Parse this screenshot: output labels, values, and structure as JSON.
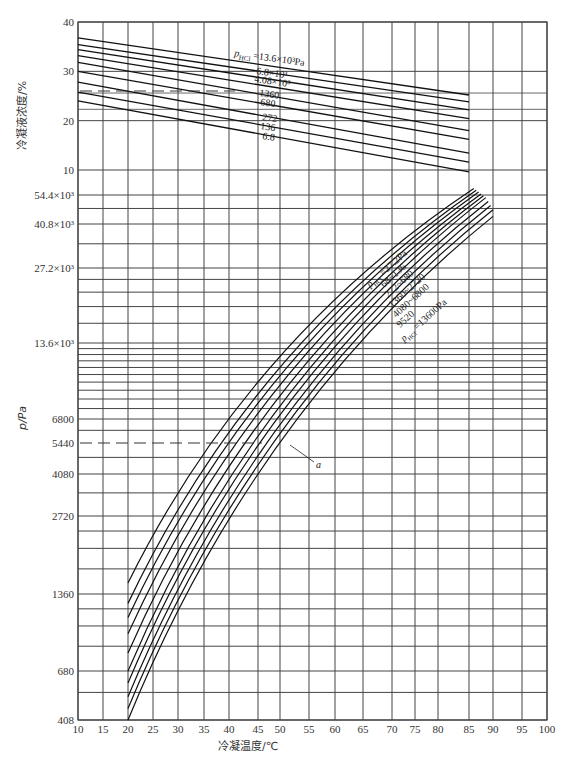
{
  "chart_data": [
    {
      "type": "line",
      "title": "",
      "ylabel": "冷凝液浓度/%",
      "xlabel": "冷凝温度/℃",
      "ylim": [
        10,
        40
      ],
      "y_ticks": [
        "40",
        "30",
        "20",
        "10"
      ],
      "x_ticks": [
        "10",
        "15",
        "20",
        "25",
        "30",
        "35",
        "40",
        "45",
        "50",
        "55",
        "60",
        "65",
        "70",
        "75",
        "80",
        "85",
        "90",
        "95",
        "100"
      ],
      "grid": true,
      "legend_prefix": "p_HCl =",
      "series": [
        {
          "name": "13.6×10³Pa",
          "x": [
            10,
            85
          ],
          "values": [
            36.8,
            25.2
          ]
        },
        {
          "name": "6.8×10³",
          "x": [
            10,
            85
          ],
          "values": [
            35.4,
            23.8
          ]
        },
        {
          "name": "4.08×10³",
          "x": [
            10,
            85
          ],
          "values": [
            34.4,
            22.2
          ]
        },
        {
          "name": "",
          "x": [
            10,
            85
          ],
          "values": [
            33.2,
            20.4
          ]
        },
        {
          "name": "1360",
          "x": [
            10,
            85
          ],
          "values": [
            31.8,
            18.0
          ]
        },
        {
          "name": "680",
          "x": [
            10,
            85
          ],
          "values": [
            30.0,
            16.2
          ]
        },
        {
          "name": "272",
          "x": [
            10,
            85
          ],
          "values": [
            27.8,
            13.4
          ]
        },
        {
          "name": "136",
          "x": [
            10,
            85
          ],
          "values": [
            25.8,
            11.6
          ]
        },
        {
          "name": "6.8",
          "x": [
            10,
            85
          ],
          "values": [
            24.0,
            9.6
          ]
        }
      ],
      "annotations": [
        {
          "type": "dashed-hline",
          "y": 25.6,
          "x_range": [
            10,
            35
          ]
        }
      ]
    },
    {
      "type": "line",
      "title": "",
      "ylabel": "p/Pa",
      "xlabel": "冷凝温度/℃",
      "y_scale": "log",
      "ylim": [
        408,
        54400
      ],
      "y_ticks": [
        "54.4×10³",
        "40.8×10³",
        "27.2×10³",
        "13.6×10³",
        "6800",
        "5440",
        "4080",
        "2720",
        "1360",
        "680",
        "408"
      ],
      "x_ticks": [
        "10",
        "15",
        "20",
        "25",
        "30",
        "35",
        "40",
        "45",
        "50",
        "55",
        "60",
        "65",
        "70",
        "75",
        "80",
        "85",
        "90",
        "95",
        "100"
      ],
      "grid": true,
      "legend_prefix": "p_HCl =",
      "series": [
        {
          "name": "27.2Pa",
          "x": [
            20,
            86
          ],
          "values": [
            1500,
            58000
          ]
        },
        {
          "name": "68",
          "x": [
            20,
            86.5
          ],
          "values": [
            1250,
            57000
          ]
        },
        {
          "name": "136",
          "x": [
            20,
            87
          ],
          "values": [
            1100,
            56000
          ]
        },
        {
          "name": "272",
          "x": [
            20,
            87.5
          ],
          "values": [
            950,
            55000
          ]
        },
        {
          "name": "680",
          "x": [
            20,
            88
          ],
          "values": [
            800,
            54000
          ]
        },
        {
          "name": "1360",
          "x": [
            20,
            88.5
          ],
          "values": [
            680,
            53000
          ]
        },
        {
          "name": "2720",
          "x": [
            20,
            89
          ],
          "values": [
            600,
            51000
          ]
        },
        {
          "name": "4080",
          "x": [
            20,
            89.5
          ],
          "values": [
            520,
            49000
          ]
        },
        {
          "name": "6800",
          "x": [
            20,
            90
          ],
          "values": [
            460,
            47000
          ]
        },
        {
          "name": "13600Pa",
          "x": [
            20,
            90
          ],
          "values": [
            408,
            44000
          ]
        }
      ],
      "annotations": [
        {
          "type": "dashed-hline",
          "y": 5440,
          "x_range": [
            10,
            45
          ]
        },
        {
          "type": "label",
          "text": "a",
          "x": 50,
          "y": 4800
        }
      ],
      "series_label_fragments": [
        "p_HCl =27.2Pa",
        "68~136",
        "272~680",
        "1360~2720",
        "4080~6800",
        "9520",
        "p_HCl =13600Pa"
      ]
    }
  ],
  "labels": {
    "upper_ylabel": "冷凝液浓度/%",
    "lower_ylabel": "p/Pa",
    "xlabel": "冷凝温度/℃",
    "upper_series_title": "p",
    "upper_series_sub": "HCl",
    "upper_series_first": " =13.6×10³Pa",
    "upper_s2": "6.8×10³",
    "upper_s3": "4.08×10³",
    "upper_s5": "1360",
    "upper_s6": "680",
    "upper_s7": "272",
    "upper_s8": "136",
    "upper_s9": "6.8",
    "lower_l1": "p",
    "lower_l1_sub": "HCl",
    "lower_l1_rest": " =27.2Pa",
    "lower_l2": "68~136",
    "lower_l3": "272~680",
    "lower_l4": "1360~2720",
    "lower_l5": "4080~6800",
    "lower_l6": "9520",
    "lower_l7": "p",
    "lower_l7_sub": "HCl",
    "lower_l7_rest": " =13600Pa",
    "annot_a": "a"
  }
}
